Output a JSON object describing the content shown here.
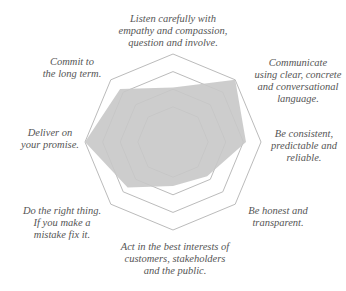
{
  "chart_data": {
    "type": "radar",
    "title": "",
    "axes": [
      "Listen carefully with empathy and compassion, question and involve.",
      "Communicate using clear, concrete and conversational language.",
      "Be consistent, predictable and reliable.",
      "Be honest and transparent.",
      "Act in the best interests of customers, stakeholders and the public.",
      "Do the right thing. If you make a mistake fix it.",
      "Deliver on your promise.",
      "Commit to the long term."
    ],
    "series": [
      {
        "name": "score",
        "values": [
          0.62,
          1.0,
          0.83,
          0.55,
          0.5,
          0.73,
          1.0,
          0.85
        ]
      }
    ],
    "rings": [
      0.4,
      0.6,
      0.8,
      1.0
    ],
    "range": [
      0,
      1
    ],
    "fill_color": "#c8c8c8",
    "grid_color": "#bbbbbb"
  },
  "labels": [
    {
      "text": "Listen carefully with\nempathy and compassion,\nquestion and involve.",
      "x": 118,
      "y": 13,
      "w": 110
    },
    {
      "text": "Communicate\nusing clear, concrete\nand conversational\nlanguage.",
      "x": 250,
      "y": 57,
      "w": 96
    },
    {
      "text": "Be consistent,\npredictable and\nreliable.",
      "x": 262,
      "y": 128,
      "w": 84
    },
    {
      "text": "Be honest and\ntransparent.",
      "x": 238,
      "y": 205,
      "w": 80
    },
    {
      "text": "Act in the best interests of\ncustomers, stakeholders\nand the public.",
      "x": 110,
      "y": 241,
      "w": 130
    },
    {
      "text": "Do the right thing.\nIf you make a\nmistake fix it.",
      "x": 12,
      "y": 205,
      "w": 100
    },
    {
      "text": "Deliver on\nyour promise.",
      "x": 14,
      "y": 127,
      "w": 72
    },
    {
      "text": "Commit to\nthe long term.",
      "x": 36,
      "y": 56,
      "w": 72
    }
  ]
}
